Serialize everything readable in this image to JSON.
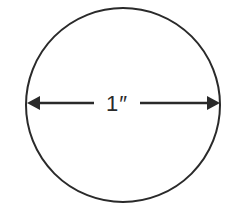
{
  "diagram": {
    "shape": "circle",
    "dimension_label": "1″",
    "dimension": "diameter",
    "arrows": [
      "left-arrowhead",
      "right-arrowhead"
    ],
    "colors": {
      "stroke": "#2a2a2a",
      "background": "#ffffff"
    }
  }
}
